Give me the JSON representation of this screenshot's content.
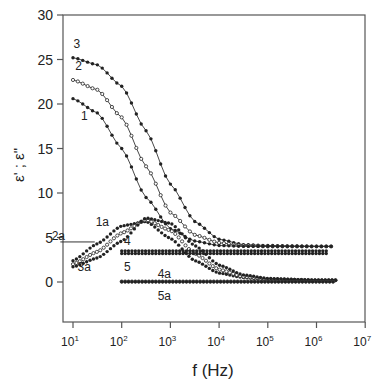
{
  "chart_data": {
    "type": "scatter",
    "title": "",
    "xlabel": "f (Hz)",
    "ylabel": "ε' ; ε\"",
    "xscale": "log",
    "xlim": [
      10,
      10000000
    ],
    "ylim": [
      -4.5,
      30
    ],
    "grid": false,
    "legend": "inline curve labels",
    "x_ticks": [
      "10^1",
      "10^2",
      "10^3",
      "10^4",
      "10^5",
      "10^6",
      "10^7"
    ],
    "y_ticks": [
      0,
      5,
      10,
      15,
      20,
      25,
      30
    ],
    "series": [
      {
        "name": "3",
        "kind": "real",
        "marker": "filled",
        "line": true,
        "x": [
          10,
          31.6,
          100,
          316,
          1000,
          3160,
          10000,
          31600,
          100000,
          1000000,
          2500000
        ],
        "values": [
          25.2,
          24.4,
          22.0,
          17.0,
          11.0,
          6.8,
          4.8,
          4.2,
          4.1,
          4.0,
          4.0
        ]
      },
      {
        "name": "2",
        "kind": "real",
        "marker": "open",
        "line": true,
        "x": [
          10,
          31.6,
          100,
          316,
          1000,
          3160,
          10000,
          31600,
          100000,
          1000000,
          2500000
        ],
        "values": [
          22.7,
          21.6,
          18.5,
          13.0,
          7.8,
          5.3,
          4.4,
          4.1,
          4.0,
          4.0,
          4.0
        ]
      },
      {
        "name": "1",
        "kind": "real",
        "marker": "filled",
        "line": true,
        "x": [
          10,
          31.6,
          100,
          316,
          1000,
          3160,
          10000,
          31600,
          100000,
          1000000,
          2500000
        ],
        "values": [
          20.6,
          19.0,
          15.0,
          9.5,
          6.0,
          4.6,
          4.1,
          4.0,
          4.0,
          4.0,
          4.0
        ]
      },
      {
        "name": "1a",
        "kind": "imag",
        "marker": "filled",
        "line": false,
        "x": [
          10,
          31.6,
          100,
          316,
          1000,
          3160,
          10000,
          31600,
          100000,
          1000000,
          2500000
        ],
        "values": [
          2.4,
          4.3,
          6.3,
          6.8,
          4.9,
          2.4,
          1.0,
          0.5,
          0.3,
          0.2,
          0.2
        ]
      },
      {
        "name": "2a",
        "kind": "imag",
        "marker": "open",
        "line": false,
        "x": [
          10,
          31.6,
          100,
          316,
          1000,
          3160,
          10000,
          31600,
          100000,
          1000000,
          2500000
        ],
        "values": [
          2.0,
          3.4,
          5.5,
          7.0,
          5.8,
          3.2,
          1.4,
          0.6,
          0.3,
          0.2,
          0.2
        ]
      },
      {
        "name": "3a",
        "kind": "imag",
        "marker": "filled",
        "line": false,
        "x": [
          10,
          31.6,
          100,
          316,
          1000,
          3160,
          10000,
          31600,
          100000,
          1000000,
          2500000
        ],
        "values": [
          1.7,
          2.7,
          4.6,
          7.2,
          6.6,
          4.1,
          1.9,
          0.8,
          0.4,
          0.2,
          0.2
        ]
      },
      {
        "name": "4",
        "kind": "real",
        "marker": "filled",
        "line": false,
        "x": [
          100,
          1000,
          10000,
          100000,
          1000000,
          1600000
        ],
        "values": [
          3.5,
          3.5,
          3.5,
          3.5,
          3.5,
          3.5
        ]
      },
      {
        "name": "5",
        "kind": "real",
        "marker": "filled",
        "line": false,
        "x": [
          100,
          1000,
          10000,
          100000,
          1000000,
          1600000
        ],
        "values": [
          3.2,
          3.2,
          3.2,
          3.2,
          3.2,
          3.2
        ]
      },
      {
        "name": "4a",
        "kind": "imag",
        "marker": "open",
        "line": false,
        "x": [
          100,
          1000,
          10000,
          100000,
          1000000,
          2500000
        ],
        "values": [
          0.05,
          0.05,
          0.05,
          0.05,
          0.05,
          0.05
        ]
      },
      {
        "name": "5a",
        "kind": "imag",
        "marker": "filled",
        "line": false,
        "x": [
          100,
          1000,
          10000,
          100000,
          1000000,
          2500000
        ],
        "values": [
          0.02,
          0.02,
          0.02,
          0.02,
          0.02,
          0.02
        ]
      }
    ],
    "annotations": [
      {
        "text": "3",
        "x": 12,
        "y": 26.3
      },
      {
        "text": "2",
        "x": 13,
        "y": 23.8
      },
      {
        "text": "1",
        "x": 17,
        "y": 18.2
      },
      {
        "text": "1a",
        "x": 40,
        "y": 6.3
      },
      {
        "text": "2a",
        "x": 5,
        "y": 4.7
      },
      {
        "text": "3a",
        "x": 17,
        "y": 1.2
      },
      {
        "text": "4",
        "x": 130,
        "y": 4.2
      },
      {
        "text": "5",
        "x": 130,
        "y": 1.2
      },
      {
        "text": "4a",
        "x": 750,
        "y": 0.5
      },
      {
        "text": "5a",
        "x": 750,
        "y": -2.0
      }
    ]
  }
}
